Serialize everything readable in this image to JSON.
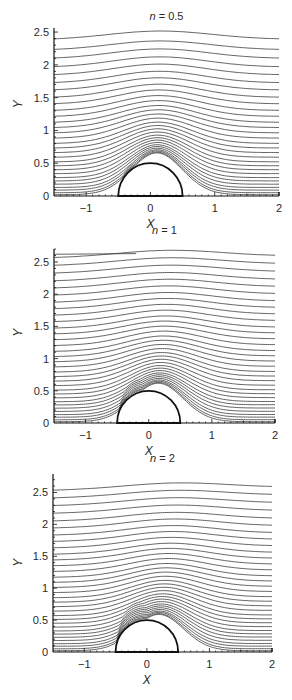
{
  "figure": {
    "panels": [
      {
        "title_var": "n",
        "title_eq": " = 0.5",
        "xlabel": "X",
        "ylabel": "Y"
      },
      {
        "title_var": "n",
        "title_eq": " = 1",
        "xlabel": "X",
        "ylabel": "Y"
      },
      {
        "title_var": "n",
        "title_eq": " = 2",
        "xlabel": "X",
        "ylabel": "Y"
      }
    ]
  },
  "chart_data": [
    {
      "type": "line",
      "subtype": "streamlines",
      "title": "n = 0.5",
      "xlabel": "X",
      "ylabel": "Y",
      "xlim": [
        -1.5,
        2
      ],
      "ylim": [
        0,
        2.55
      ],
      "xticks": [
        -1,
        0,
        1,
        2
      ],
      "yticks": [
        0,
        0.5,
        1,
        1.5,
        2,
        2.5
      ],
      "obstacle": {
        "shape": "semicircle",
        "center": [
          0,
          0
        ],
        "radius": 0.5
      },
      "streamline_count": 30,
      "inlet_y_levels": [
        0.02,
        0.05,
        0.09,
        0.13,
        0.18,
        0.23,
        0.28,
        0.34,
        0.4,
        0.46,
        0.52,
        0.59,
        0.66,
        0.73,
        0.8,
        0.88,
        0.96,
        1.04,
        1.12,
        1.21,
        1.3,
        1.4,
        1.5,
        1.61,
        1.72,
        1.84,
        1.96,
        2.09,
        2.22,
        2.38
      ],
      "bump_height": 0.2,
      "downstream_shift": 0.02,
      "grid": false,
      "pixel_frame": {
        "top": 20,
        "x0": 54,
        "x1": 279,
        "y0": 196,
        "y_top": 28
      }
    },
    {
      "type": "line",
      "subtype": "streamlines",
      "title": "n = 1",
      "xlabel": "X",
      "ylabel": "Y",
      "xlim": [
        -1.5,
        2
      ],
      "ylim": [
        0,
        2.7
      ],
      "xticks": [
        -1,
        0,
        1,
        2
      ],
      "yticks": [
        0,
        0.5,
        1,
        1.5,
        2,
        2.5
      ],
      "obstacle": {
        "shape": "semicircle",
        "center": [
          0,
          0
        ],
        "radius": 0.5
      },
      "streamline_count": 33,
      "inlet_y_levels": [
        0.02,
        0.05,
        0.09,
        0.13,
        0.18,
        0.23,
        0.28,
        0.33,
        0.39,
        0.45,
        0.51,
        0.58,
        0.65,
        0.72,
        0.79,
        0.87,
        0.95,
        1.03,
        1.11,
        1.2,
        1.29,
        1.38,
        1.47,
        1.57,
        1.67,
        1.77,
        1.87,
        1.98,
        2.09,
        2.2,
        2.32,
        2.44,
        2.56
      ],
      "partial_top_line": {
        "y": 2.62,
        "x_end": -0.2
      },
      "bump_height": 0.16,
      "downstream_shift": 0.07,
      "grid": false,
      "pixel_frame": {
        "top": 234,
        "x0": 54,
        "x1": 275,
        "y0": 423,
        "y_top": 249
      }
    },
    {
      "type": "line",
      "subtype": "streamlines",
      "title": "n = 2",
      "xlabel": "X",
      "ylabel": "Y",
      "xlim": [
        -1.5,
        2
      ],
      "ylim": [
        0,
        2.75
      ],
      "xticks": [
        -1,
        0,
        1,
        2
      ],
      "yticks": [
        0,
        0.5,
        1,
        1.5,
        2,
        2.5
      ],
      "obstacle": {
        "shape": "semicircle",
        "center": [
          0,
          0
        ],
        "radius": 0.5
      },
      "streamline_count": 32,
      "inlet_y_levels": [
        0.02,
        0.05,
        0.09,
        0.13,
        0.18,
        0.23,
        0.28,
        0.33,
        0.39,
        0.45,
        0.51,
        0.57,
        0.64,
        0.71,
        0.78,
        0.85,
        0.93,
        1.01,
        1.09,
        1.17,
        1.26,
        1.35,
        1.44,
        1.53,
        1.63,
        1.73,
        1.83,
        1.94,
        2.05,
        2.17,
        2.29,
        2.41,
        2.53
      ],
      "bump_height": 0.13,
      "downstream_shift": 0.11,
      "grid": false,
      "pixel_frame": {
        "top": 462,
        "x0": 53,
        "x1": 272,
        "y0": 652,
        "y_top": 474
      }
    }
  ]
}
